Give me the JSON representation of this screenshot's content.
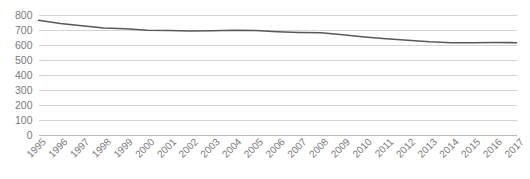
{
  "chart_data": {
    "type": "line",
    "title": "",
    "subtitle": "",
    "xlabel": "",
    "ylabel": "",
    "legend": [],
    "legend_position": "none",
    "grid": true,
    "grid_axis": "y",
    "xlim": [
      1995,
      2017
    ],
    "ylim": [
      0,
      800
    ],
    "y_ticks": [
      0,
      100,
      200,
      300,
      400,
      500,
      600,
      700,
      800
    ],
    "y_tick_labels": [
      "0",
      "100",
      "200",
      "300",
      "400",
      "500",
      "600",
      "700",
      "800"
    ],
    "categories": [
      "1995",
      "1996",
      "1997",
      "1998",
      "1999",
      "2000",
      "2001",
      "2002",
      "2003",
      "2004",
      "2005",
      "2006",
      "2007",
      "2008",
      "2009",
      "2010",
      "2011",
      "2012",
      "2013",
      "2014",
      "2015",
      "2016",
      "2017"
    ],
    "series": [
      {
        "name": "series-1",
        "color": "#595959",
        "values": [
          762,
          740,
          725,
          710,
          705,
          695,
          693,
          690,
          692,
          695,
          693,
          685,
          680,
          678,
          665,
          650,
          638,
          628,
          618,
          612,
          612,
          613,
          612
        ]
      }
    ]
  },
  "axes": {
    "y_axis_name": "value-axis",
    "x_axis_name": "year-axis"
  },
  "colors": {
    "line": "#595959",
    "gridline": "#d4d4d4",
    "axis": "#b8b8b8",
    "tick_text": "#7a7a7a",
    "background": "#ffffff"
  }
}
